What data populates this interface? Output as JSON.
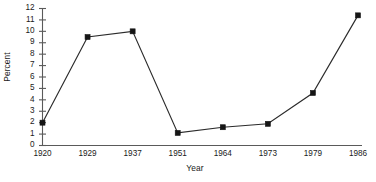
{
  "chart_data": {
    "type": "line",
    "title": "",
    "xlabel": "Year",
    "ylabel": "Percent",
    "categories": [
      "1920",
      "1929",
      "1937",
      "1951",
      "1964",
      "1973",
      "1979",
      "1986"
    ],
    "values": [
      2.0,
      9.5,
      10.0,
      1.1,
      1.6,
      1.9,
      4.6,
      11.4
    ],
    "series": [
      {
        "name": "Percent",
        "values": [
          2.0,
          9.5,
          10.0,
          1.1,
          1.6,
          1.9,
          4.6,
          11.4
        ]
      }
    ],
    "ylim": [
      0,
      12
    ],
    "ytick_labels": [
      "0",
      "1",
      "2",
      "3",
      "4",
      "5",
      "6",
      "7",
      "8",
      "9",
      "10",
      "11",
      "12"
    ],
    "ytick_values": [
      0,
      1,
      2,
      3,
      4,
      5,
      6,
      7,
      8,
      9,
      10,
      11,
      12
    ],
    "grid": false,
    "legend": false,
    "legend_position": "none",
    "marker": "square",
    "line_color": "#2b2b2b",
    "marker_color": "#151515",
    "axis_color": "#5a5a5a",
    "background_color": "#ffffff"
  }
}
